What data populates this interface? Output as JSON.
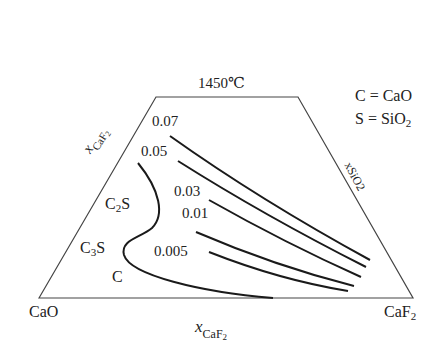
{
  "title": "1450℃",
  "legend": {
    "line1": "C = CaO",
    "line2_main": "S = SiO",
    "line2_sub": "2"
  },
  "corners": {
    "left": "CaO",
    "right_main": "CaF",
    "right_sub": "2"
  },
  "axes": {
    "bottom_x": "x",
    "bottom_sub": "CaF",
    "bottom_sub2": "2",
    "left_x": "x",
    "left_sub": "CaF",
    "left_sub2": "2",
    "right_label": "xSiO2"
  },
  "regions": {
    "c2s_main": "C",
    "c2s_sub": "2",
    "c2s_end": "S",
    "c3s_main": "C",
    "c3s_sub": "3",
    "c3s_end": "S",
    "c": "C"
  },
  "iso_labels": [
    "0.07",
    "0.05",
    "0.03",
    "0.01",
    "0.005"
  ],
  "colors": {
    "frame": "#444444",
    "curves": "#1a1a1a"
  }
}
